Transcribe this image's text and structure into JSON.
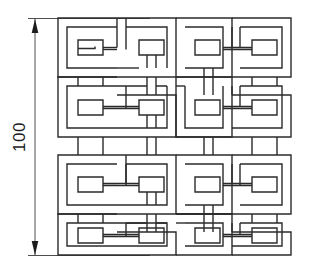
{
  "figure": {
    "type": "technical-drawing",
    "background_color": "#ffffff",
    "stroke_color": "#2b2b2b",
    "stroke_width": 1.4,
    "pattern": {
      "name": "greek-key-knot",
      "grid_columns": 4,
      "grid_rows": 4,
      "motif_count": 16,
      "motif_name": "square-spiral-meander",
      "bounds": {
        "x": 58,
        "y": 18,
        "width": 233,
        "height": 237
      }
    },
    "dimension": {
      "name": "overall-height",
      "value": "100",
      "orientation": "vertical",
      "arrow_start": "up",
      "arrow_end": "down",
      "line_x": 35,
      "line_top": 19,
      "line_bottom": 254,
      "extension_top_y": 18,
      "extension_bottom_y": 255
    }
  }
}
